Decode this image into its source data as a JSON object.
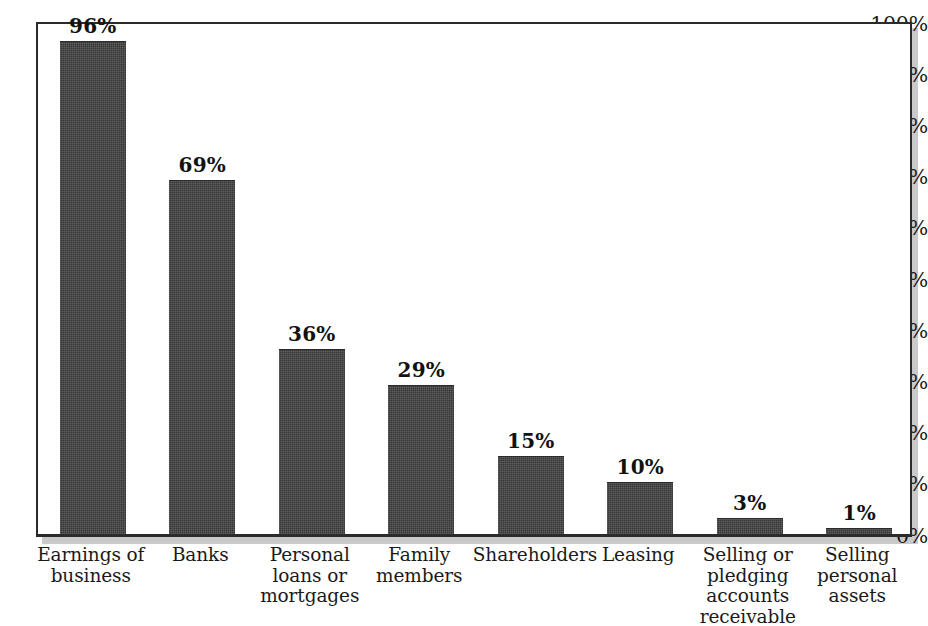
{
  "chart_data": {
    "type": "bar",
    "title": "",
    "subtitle": "",
    "xlabel": "",
    "ylabel": "",
    "ylim": [
      0,
      100
    ],
    "grid": false,
    "legend": null,
    "legend_position": "none",
    "value_label_suffix": "%",
    "categories": [
      "Earnings of\nbusiness",
      "Banks",
      "Personal\nloans or\nmortgages",
      "Family\nmembers",
      "Shareholders",
      "Leasing",
      "Selling or\npledging\naccounts\nreceivable",
      "Selling\npersonal\nassets"
    ],
    "values": [
      96,
      69,
      36,
      29,
      15,
      10,
      3,
      1
    ],
    "value_labels": [
      "96%",
      "69%",
      "36%",
      "29%",
      "15%",
      "10%",
      "3%",
      "1%"
    ],
    "ytick_values": [
      0,
      10,
      20,
      30,
      40,
      50,
      60,
      70,
      80,
      90,
      100
    ],
    "ytick_labels": [
      "0%",
      "10%",
      "20%",
      "30%",
      "40%",
      "50%",
      "60%",
      "70%",
      "80%",
      "90%",
      "100%"
    ],
    "bar_color": "#373737",
    "axis_color": "#2b2b2b",
    "background_color": "#ffffff"
  }
}
